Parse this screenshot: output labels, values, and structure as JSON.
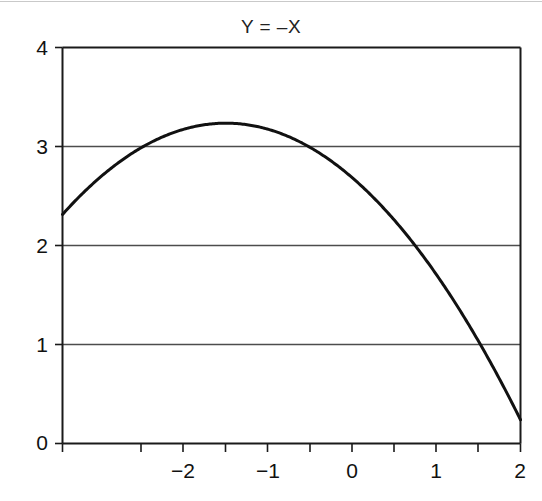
{
  "chart_data": {
    "type": "line",
    "title": "Y = –X",
    "xlabel": "",
    "ylabel": "",
    "xlim": [
      -2.74,
      2.0
    ],
    "ylim": [
      0,
      4
    ],
    "grid": "horizontal",
    "legend": "none",
    "x_ticks_major": [
      -2,
      -1,
      0,
      1,
      2
    ],
    "x_tick_labels": [
      "−2",
      "−1",
      "0",
      "1",
      "2"
    ],
    "x_ticks_minor": [
      -2.5,
      -1.5,
      -0.5,
      0.5,
      1.5
    ],
    "y_ticks_major": [
      0,
      1,
      2,
      3,
      4
    ],
    "y_tick_labels": [
      "0",
      "1",
      "2",
      "3",
      "4"
    ],
    "gridlines_y": [
      1,
      2,
      3
    ],
    "series": [
      {
        "name": "curve",
        "color": "#111111",
        "x": [
          -2.74,
          -2.6,
          -2.4,
          -2.2,
          -2.0,
          -1.8,
          -1.6,
          -1.4,
          -1.2,
          -1.05,
          -0.9,
          -0.7,
          -0.5,
          -0.3,
          -0.1,
          0.1,
          0.3,
          0.5,
          0.7,
          0.9,
          1.1,
          1.3,
          1.5,
          1.7,
          1.9,
          2.0
        ],
        "y": [
          2.21,
          2.43,
          2.66,
          2.86,
          3.02,
          3.14,
          3.13,
          3.19,
          3.22,
          3.23,
          3.22,
          3.19,
          3.13,
          3.05,
          2.93,
          2.8,
          2.64,
          2.45,
          2.24,
          2.0,
          1.74,
          1.45,
          1.14,
          0.81,
          0.45,
          0.26
        ]
      }
    ],
    "colors": {
      "curve": "#111111",
      "axis": "#1a1a1a",
      "grid": "#4d4d4d",
      "background": "#ffffff",
      "text": "#111111"
    }
  },
  "axis_labels": {
    "y": [
      {
        "value": "4",
        "name": "y-tick-4"
      },
      {
        "value": "3",
        "name": "y-tick-3"
      },
      {
        "value": "2",
        "name": "y-tick-2"
      },
      {
        "value": "1",
        "name": "y-tick-1"
      },
      {
        "value": "0",
        "name": "y-tick-0"
      }
    ],
    "x": [
      {
        "value": "−2",
        "name": "x-tick-neg2"
      },
      {
        "value": "−1",
        "name": "x-tick-neg1"
      },
      {
        "value": "0",
        "name": "x-tick-0"
      },
      {
        "value": "1",
        "name": "x-tick-1"
      },
      {
        "value": "2",
        "name": "x-tick-2"
      }
    ]
  }
}
